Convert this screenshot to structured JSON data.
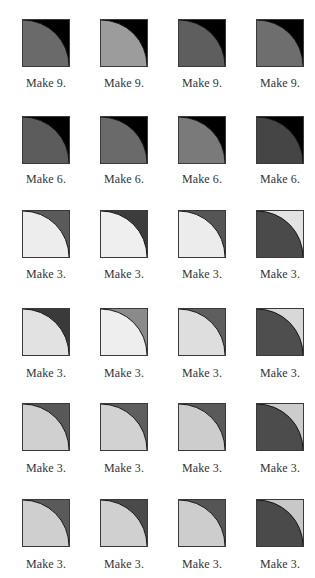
{
  "columns_x": [
    22,
    100,
    178,
    256
  ],
  "rows": [
    {
      "top": 19,
      "label_top": 76,
      "blocks": [
        {
          "label": "Make 9.",
          "quarter": "#6a6a6a",
          "corner": "#000000"
        },
        {
          "label": "Make 9.",
          "quarter": "#9c9c9c",
          "corner": "#000000"
        },
        {
          "label": "Make 9.",
          "quarter": "#5e5e5e",
          "corner": "#000000"
        },
        {
          "label": "Make 9.",
          "quarter": "#6e6e6e",
          "corner": "#000000"
        }
      ]
    },
    {
      "top": 116,
      "label_top": 172,
      "blocks": [
        {
          "label": "Make 6.",
          "quarter": "#5c5c5c",
          "corner": "#000000"
        },
        {
          "label": "Make 6.",
          "quarter": "#6a6a6a",
          "corner": "#000000"
        },
        {
          "label": "Make 6.",
          "quarter": "#7a7a7a",
          "corner": "#000000"
        },
        {
          "label": "Make 6.",
          "quarter": "#454545",
          "corner": "#000000"
        }
      ]
    },
    {
      "top": 210,
      "label_top": 267,
      "blocks": [
        {
          "label": "Make 3.",
          "quarter": "#ededed",
          "corner": "#5a5a5a"
        },
        {
          "label": "Make 3.",
          "quarter": "#efefef",
          "corner": "#3c3c3c"
        },
        {
          "label": "Make 3.",
          "quarter": "#ececec",
          "corner": "#555555"
        },
        {
          "label": "Make 3.",
          "quarter": "#4a4a4a",
          "corner": "#e2e2e2"
        }
      ]
    },
    {
      "top": 308,
      "label_top": 366,
      "blocks": [
        {
          "label": "Make 3.",
          "quarter": "#e2e2e2",
          "corner": "#3a3a3a"
        },
        {
          "label": "Make 3.",
          "quarter": "#eeeeee",
          "corner": "#8a8a8a"
        },
        {
          "label": "Make 3.",
          "quarter": "#dedede",
          "corner": "#5e5e5e"
        },
        {
          "label": "Make 3.",
          "quarter": "#4e4e4e",
          "corner": "#d8d8d8"
        }
      ]
    },
    {
      "top": 403,
      "label_top": 461,
      "blocks": [
        {
          "label": "Make 3.",
          "quarter": "#d0d0d0",
          "corner": "#585858"
        },
        {
          "label": "Make 3.",
          "quarter": "#d2d2d2",
          "corner": "#5e5e5e"
        },
        {
          "label": "Make 3.",
          "quarter": "#cdcdcd",
          "corner": "#5a5a5a"
        },
        {
          "label": "Make 3.",
          "quarter": "#4c4c4c",
          "corner": "#cccccc"
        }
      ]
    },
    {
      "top": 499,
      "label_top": 557,
      "blocks": [
        {
          "label": "Make 3.",
          "quarter": "#cfcfcf",
          "corner": "#5a5a5a"
        },
        {
          "label": "Make 3.",
          "quarter": "#d0d0d0",
          "corner": "#4a4a4a"
        },
        {
          "label": "Make 3.",
          "quarter": "#cdcdcd",
          "corner": "#555555"
        },
        {
          "label": "Make 3.",
          "quarter": "#4a4a4a",
          "corner": "#c8c8c8"
        }
      ]
    }
  ]
}
